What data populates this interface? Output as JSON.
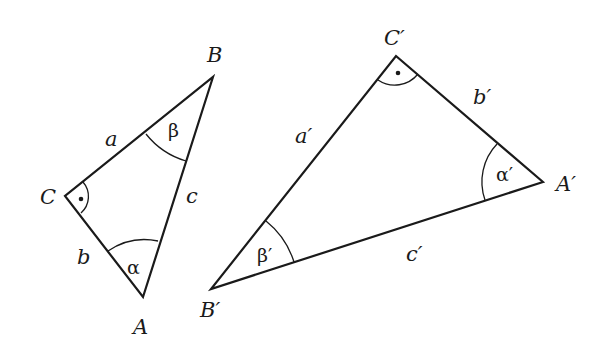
{
  "figure": {
    "line_color": "#1a1a1a",
    "background": "#ffffff"
  },
  "triangle1": {
    "vertices": {
      "A": {
        "label": "A",
        "x": 143,
        "y": 297
      },
      "B": {
        "label": "B",
        "x": 213,
        "y": 77
      },
      "C": {
        "label": "C",
        "x": 65,
        "y": 196
      }
    },
    "sides": {
      "a": "a",
      "b": "b",
      "c": "c"
    },
    "angles": {
      "alpha": "α",
      "beta": "β",
      "right_angle_marker": "•"
    }
  },
  "triangle2": {
    "vertices": {
      "A": {
        "label": "A′",
        "x": 543,
        "y": 182
      },
      "B": {
        "label": "B′",
        "x": 211,
        "y": 289
      },
      "C": {
        "label": "C′",
        "x": 396,
        "y": 56
      }
    },
    "sides": {
      "a": "a′",
      "b": "b′",
      "c": "c′"
    },
    "angles": {
      "alpha": "α′",
      "beta": "β′",
      "right_angle_marker": "•"
    }
  }
}
